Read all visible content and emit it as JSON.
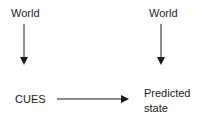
{
  "diagram": {
    "nodes": [
      {
        "id": "world-left",
        "label": "World"
      },
      {
        "id": "world-right",
        "label": "World"
      },
      {
        "id": "cues",
        "label": "CUES"
      },
      {
        "id": "predicted-state",
        "label_line1": "Predicted",
        "label_line2": "state"
      }
    ],
    "edges": [
      {
        "from": "world-left",
        "to": "cues"
      },
      {
        "from": "world-right",
        "to": "predicted-state"
      },
      {
        "from": "cues",
        "to": "predicted-state"
      }
    ],
    "colors": {
      "stroke": "#1a1a1a",
      "background": "#ffffff"
    }
  }
}
